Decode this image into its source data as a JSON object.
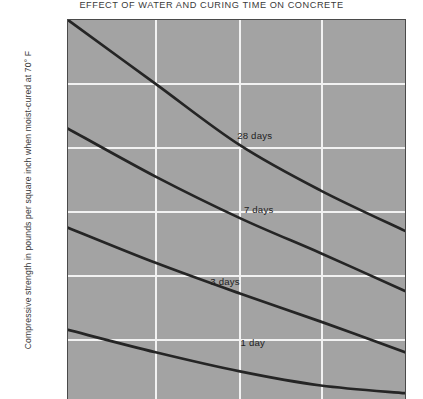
{
  "chart_data": {
    "type": "line",
    "title": "EFFECT OF WATER AND CURING TIME ON CONCRETE",
    "xlabel": "",
    "ylabel": "Compressive strength in pounds per square inch when moist-cured at 70° F",
    "ylim": [
      0,
      6000
    ],
    "yticks": [
      6000,
      5000,
      4000,
      3000,
      2000,
      1000
    ],
    "ytick_labels": [
      "6000",
      "5000",
      "4000",
      "3000",
      "2000",
      "1000"
    ],
    "grid": true,
    "legend": "inline-curve-labels",
    "x_axis_note": "x-axis ticks and labels are cropped out of the visible image (water-cement ratio increasing left to right)",
    "xlim_fraction": [
      0,
      1
    ],
    "x_gridlines_fraction": [
      0.26,
      0.51,
      0.75
    ],
    "series": [
      {
        "name": "28 days",
        "label": "28 days",
        "points": [
          {
            "x": 0.0,
            "y": 6000
          },
          {
            "x": 0.26,
            "y": 5000
          },
          {
            "x": 0.51,
            "y": 4040
          },
          {
            "x": 0.75,
            "y": 3330
          },
          {
            "x": 1.0,
            "y": 2700
          }
        ]
      },
      {
        "name": "7 days",
        "label": "7 days",
        "points": [
          {
            "x": 0.0,
            "y": 4300
          },
          {
            "x": 0.26,
            "y": 3550
          },
          {
            "x": 0.51,
            "y": 2900
          },
          {
            "x": 0.75,
            "y": 2350
          },
          {
            "x": 1.0,
            "y": 1760
          }
        ]
      },
      {
        "name": "3 days",
        "label": "3 days",
        "points": [
          {
            "x": 0.0,
            "y": 2750
          },
          {
            "x": 0.26,
            "y": 2200
          },
          {
            "x": 0.51,
            "y": 1720
          },
          {
            "x": 0.75,
            "y": 1280
          },
          {
            "x": 1.0,
            "y": 800
          }
        ]
      },
      {
        "name": "1 day",
        "label": "1 day",
        "points": [
          {
            "x": 0.0,
            "y": 1150
          },
          {
            "x": 0.26,
            "y": 800
          },
          {
            "x": 0.51,
            "y": 500
          },
          {
            "x": 0.75,
            "y": 280
          },
          {
            "x": 1.0,
            "y": 160
          }
        ]
      }
    ],
    "annotations": [
      {
        "text": "28 days",
        "x_fraction": 0.6,
        "y": 4180
      },
      {
        "text": "7 days",
        "x_fraction": 0.62,
        "y": 3020
      },
      {
        "text": "3 days",
        "x_fraction": 0.52,
        "y": 1900
      },
      {
        "text": "1 day",
        "x_fraction": 0.61,
        "y": 940
      }
    ],
    "colors": {
      "plot_background": "#a3a3a3",
      "gridline": "#f2f2f2",
      "curve": "#252525",
      "axis": "#4a4a4a",
      "text": "#2e2e2e",
      "figure_background": "#ffffff"
    }
  }
}
